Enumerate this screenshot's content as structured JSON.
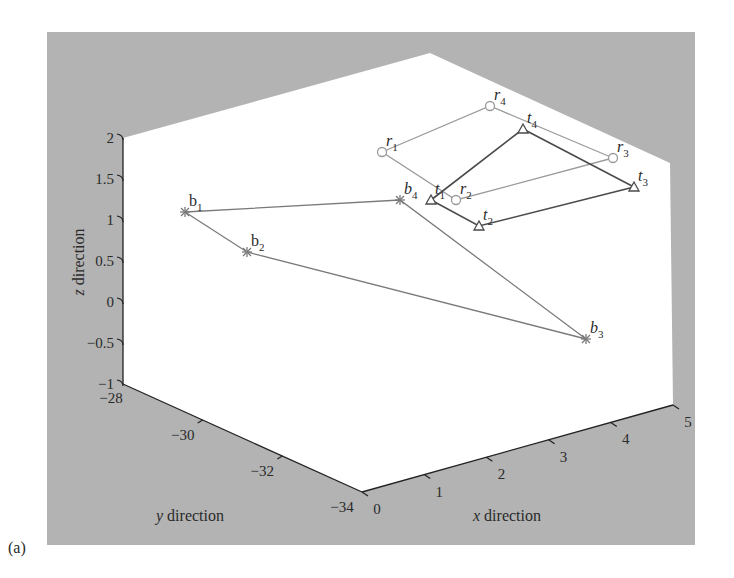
{
  "panel_label": "(a)",
  "colors": {
    "panel_bg": "#b3b3b3",
    "plot_bg": "#ffffff",
    "axis": "#222222",
    "b_series": "#7a7a7a",
    "r_series": "#9a9a9a",
    "t_series": "#4a4a4a",
    "text": "#2a2a2a"
  },
  "chart_data": {
    "type": "scatter3d",
    "title": "",
    "xlabel": "x direction",
    "ylabel": "y direction",
    "zlabel": "z direction",
    "xlim": [
      0,
      5
    ],
    "ylim": [
      -34,
      -28
    ],
    "zlim": [
      -1,
      2
    ],
    "xticks": [
      "0",
      "1",
      "2",
      "3",
      "4",
      "5"
    ],
    "yticks": [
      "-28",
      "-30",
      "-32",
      "-34"
    ],
    "zticks": [
      "2",
      "1.5",
      "1",
      "0.5",
      "0",
      "-0.5",
      "-1"
    ],
    "grid": false,
    "legend": null,
    "series": [
      {
        "name": "b",
        "marker": "asterisk",
        "style": "polyline",
        "order": [
          "b1",
          "b2",
          "b3",
          "b4",
          "b1"
        ],
        "points": [
          {
            "label": "b",
            "sub": "1",
            "italic": false,
            "screen": [
              185,
              212
            ]
          },
          {
            "label": "b",
            "sub": "2",
            "italic": false,
            "screen": [
              247,
              252
            ]
          },
          {
            "label": "b",
            "sub": "3",
            "italic": true,
            "screen": [
              586,
              339
            ]
          },
          {
            "label": "b",
            "sub": "4",
            "italic": true,
            "screen": [
              400,
              200
            ]
          }
        ]
      },
      {
        "name": "r",
        "marker": "circle",
        "style": "closed-quad",
        "order": [
          "r1",
          "r2",
          "r3",
          "r4",
          "r1"
        ],
        "points": [
          {
            "label": "r",
            "sub": "1",
            "italic": true,
            "screen": [
              382,
              152
            ]
          },
          {
            "label": "r",
            "sub": "2",
            "italic": true,
            "screen": [
              456,
              200
            ]
          },
          {
            "label": "r",
            "sub": "3",
            "italic": true,
            "screen": [
              613,
              158
            ]
          },
          {
            "label": "r",
            "sub": "4",
            "italic": true,
            "screen": [
              490,
              106
            ]
          }
        ]
      },
      {
        "name": "t",
        "marker": "triangle",
        "style": "closed-quad",
        "order": [
          "t1",
          "t2",
          "t3",
          "t4",
          "t1"
        ],
        "points": [
          {
            "label": "t",
            "sub": "1",
            "italic": true,
            "screen": [
              431,
              200
            ]
          },
          {
            "label": "t",
            "sub": "2",
            "italic": true,
            "screen": [
              479,
              226
            ]
          },
          {
            "label": "t",
            "sub": "3",
            "italic": true,
            "screen": [
              634,
              187
            ]
          },
          {
            "label": "t",
            "sub": "4",
            "italic": true,
            "screen": [
              523,
              129
            ]
          }
        ]
      }
    ]
  }
}
